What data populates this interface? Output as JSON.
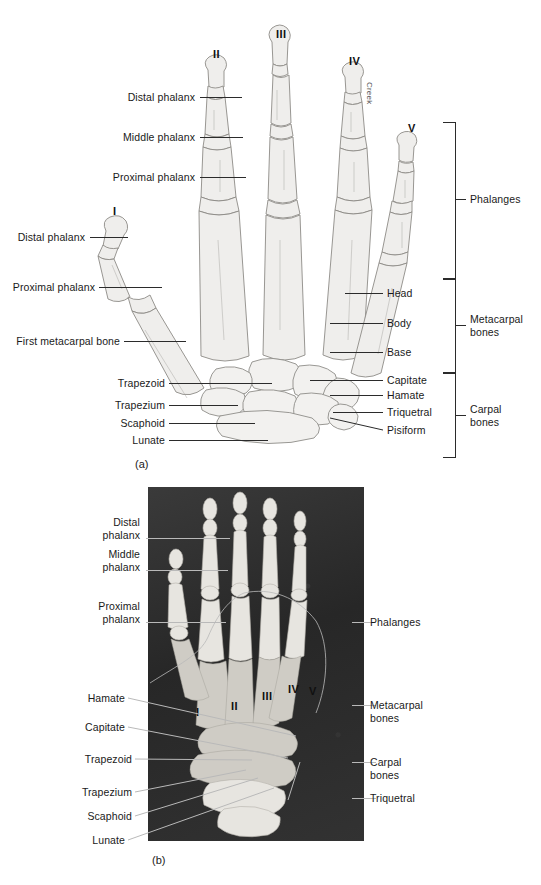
{
  "figure": {
    "panels": [
      {
        "id": "a",
        "caption": "(a)",
        "type": "illustration",
        "credit": "Creek"
      },
      {
        "id": "b",
        "caption": "(b)",
        "type": "photograph"
      }
    ]
  },
  "panel_a": {
    "caption": "(a)",
    "credit": "Creek",
    "digit_numerals": [
      {
        "label": "I",
        "x": 113,
        "y": 205
      },
      {
        "label": "II",
        "x": 213,
        "y": 48
      },
      {
        "label": "III",
        "x": 276,
        "y": 28
      },
      {
        "label": "IV",
        "x": 349,
        "y": 55
      },
      {
        "label": "V",
        "x": 408,
        "y": 122
      }
    ],
    "left_labels": [
      {
        "text": "Distal phalanx",
        "y": 97,
        "line_to_x": 242
      },
      {
        "text": "Middle phalanx",
        "y": 137,
        "line_to_x": 243
      },
      {
        "text": "Proximal phalanx",
        "y": 177,
        "line_to_x": 246
      },
      {
        "text": "Distal phalanx",
        "y": 237,
        "line_to_x": 128
      },
      {
        "text": "Proximal phalanx",
        "y": 287,
        "line_to_x": 162
      },
      {
        "text": "First metacarpal bone",
        "y": 341,
        "line_to_x": 186
      },
      {
        "text": "Trapezoid",
        "y": 383,
        "line_to_x": 272
      },
      {
        "text": "Trapezium",
        "y": 405,
        "line_to_x": 238
      },
      {
        "text": "Scaphoid",
        "y": 423,
        "line_to_x": 255
      },
      {
        "text": "Lunate",
        "y": 440,
        "line_to_x": 268
      }
    ],
    "right_labels": [
      {
        "text": "Head",
        "y": 293,
        "line_from_x": 345
      },
      {
        "text": "Body",
        "y": 323,
        "line_from_x": 330
      },
      {
        "text": "Base",
        "y": 352,
        "line_from_x": 330
      },
      {
        "text": "Capitate",
        "y": 380,
        "line_from_x": 318
      },
      {
        "text": "Hamate",
        "y": 395,
        "line_from_x": 330
      },
      {
        "text": "Triquetral",
        "y": 412,
        "line_from_x": 333
      },
      {
        "text": "Pisiform",
        "y": 430,
        "line_from_x": 330
      }
    ],
    "group_brackets": [
      {
        "text": "Phalanges",
        "y_top": 122,
        "y_bottom": 278,
        "tick_y": 199
      },
      {
        "text": "Metacarpal\nbones",
        "y_top": 278,
        "y_bottom": 372,
        "tick_y": 325
      },
      {
        "text": "Carpal\nbones",
        "y_top": 372,
        "y_bottom": 456,
        "tick_y": 415
      }
    ]
  },
  "panel_b": {
    "caption": "(b)",
    "photo": {
      "x": 148,
      "y": 487,
      "width": 216,
      "height": 354,
      "background": "#2e2e2e"
    },
    "digit_numerals": [
      {
        "label": "I",
        "x": 196,
        "y": 712
      },
      {
        "label": "II",
        "x": 231,
        "y": 706
      },
      {
        "label": "III",
        "x": 262,
        "y": 696
      },
      {
        "label": "IV",
        "x": 288,
        "y": 689
      },
      {
        "label": "V",
        "x": 309,
        "y": 691
      }
    ],
    "left_labels": [
      {
        "text": "Distal\nphalanx",
        "y": 516,
        "line_y": 538,
        "line_to_x": 230
      },
      {
        "text": "Middle\nphalanx",
        "y": 548,
        "line_y": 570,
        "line_to_x": 228
      },
      {
        "text": "Proximal\nphalanx",
        "y": 600,
        "line_y": 622,
        "line_to_x": 226
      },
      {
        "text": "Hamate",
        "y": 693,
        "line_y": 698,
        "line_to_x": 296
      },
      {
        "text": "Capitate",
        "y": 722,
        "line_y": 727,
        "line_to_x": 288
      },
      {
        "text": "Trapezoid",
        "y": 755,
        "line_y": 759,
        "line_to_x": 252
      },
      {
        "text": "Trapezium",
        "y": 788,
        "line_y": 792,
        "line_to_x": 246
      },
      {
        "text": "Scaphoid",
        "y": 812,
        "line_y": 816,
        "line_to_x": 258
      },
      {
        "text": "Lunate",
        "y": 836,
        "line_y": 840,
        "line_to_x": 274
      }
    ],
    "right_labels": [
      {
        "text": "Phalanges",
        "y": 622,
        "line_from_x": 330
      },
      {
        "text": "Metacarpal\nbones",
        "y": 705,
        "line_from_x": 312
      },
      {
        "text": "Carpal\nbones",
        "y": 762,
        "line_from_x": 316
      },
      {
        "text": "Triquetral",
        "y": 798,
        "line_from_x": 318
      }
    ]
  },
  "colors": {
    "ink": "#1a1a1a",
    "leader": "#2b2b2b",
    "leader_light": "#b9b9b9",
    "photo_bg": "#2e2e2e",
    "bone_fill": "#f2f1ef",
    "bone_stroke": "#8f8d89"
  }
}
